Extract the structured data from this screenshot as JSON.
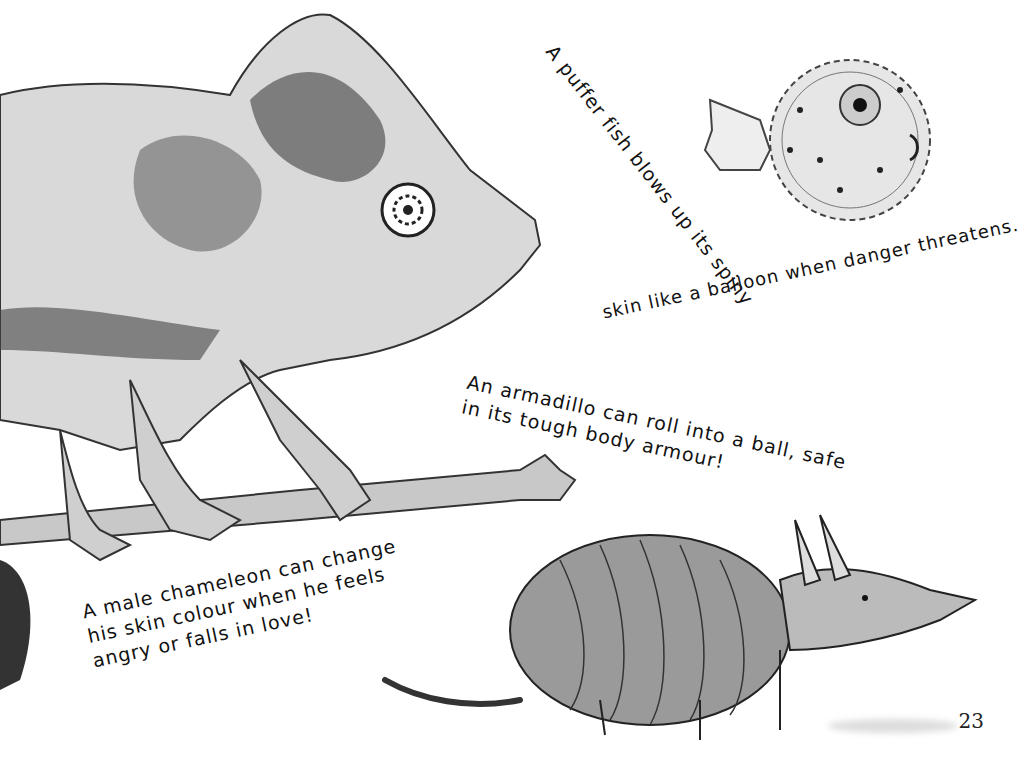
{
  "page": {
    "number": "23"
  },
  "captions": {
    "pufferfish": {
      "line1": "A puffer fish blows up its spiny",
      "line2": "skin like a balloon when danger threatens."
    },
    "armadillo": {
      "line1": "An armadillo can roll into a ball, safe",
      "line2": "in its tough body armour!"
    },
    "chameleon": {
      "line1": "A male chameleon can change",
      "line2": "his skin colour when he feels",
      "line3": "angry or falls in love!"
    }
  },
  "illustrations": {
    "chameleon": "chameleon-illustration",
    "pufferfish": "pufferfish-illustration",
    "armadillo": "armadillo-illustration"
  },
  "colors": {
    "ink": "#111111",
    "paper": "#ffffff",
    "wash": "#bdbdbd"
  }
}
